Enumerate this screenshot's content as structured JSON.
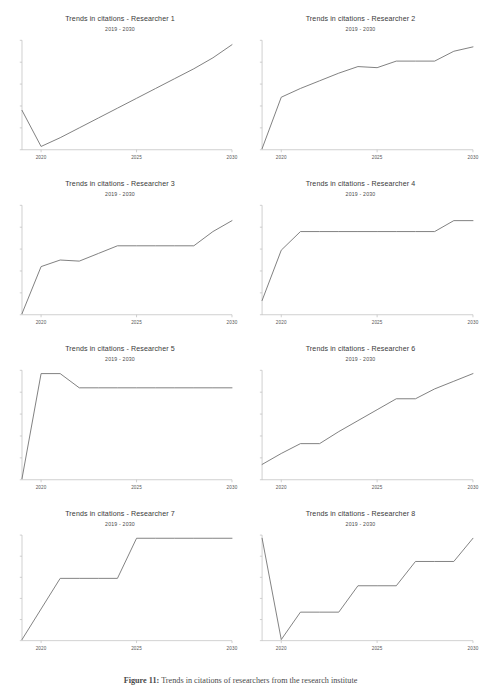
{
  "figure": {
    "caption_label": "Figure 11:",
    "caption_text": "Trends in citations of researchers from the research institute",
    "line_color": "#6e6e6e",
    "axis_color": "#bdbdbd"
  },
  "chart_data": [
    {
      "type": "line",
      "title": "Trends in citations - Researcher 1",
      "subtitle": "2019 - 2030",
      "xlabel": "",
      "ylabel": "",
      "xlim": [
        2019,
        2030
      ],
      "ylim": [
        0,
        10
      ],
      "xticks": [
        2020,
        2025,
        2030
      ],
      "xtick_labels": [
        "2020",
        "2025",
        "2030"
      ],
      "yticks": [
        0,
        2,
        4,
        6,
        8,
        10
      ],
      "ytick_labels": [
        "",
        "",
        "",
        "",
        "",
        ""
      ],
      "grid": false,
      "legend": false,
      "x": [
        2019,
        2020,
        2021,
        2022,
        2023,
        2024,
        2025,
        2026,
        2027,
        2028,
        2029,
        2030
      ],
      "values": [
        3.6,
        0.3,
        1.1,
        2.0,
        2.9,
        3.8,
        4.7,
        5.6,
        6.5,
        7.4,
        8.4,
        9.6
      ]
    },
    {
      "type": "line",
      "title": "Trends in citations - Researcher 2",
      "subtitle": "2019 - 2030",
      "xlabel": "",
      "ylabel": "",
      "xlim": [
        2019,
        2030
      ],
      "ylim": [
        0,
        10
      ],
      "xticks": [
        2020,
        2025,
        2030
      ],
      "xtick_labels": [
        "2020",
        "2025",
        "2030"
      ],
      "yticks": [
        0,
        2,
        4,
        6,
        8,
        10
      ],
      "ytick_labels": [
        "",
        "",
        "",
        "",
        "",
        ""
      ],
      "grid": false,
      "legend": false,
      "x": [
        2019,
        2020,
        2021,
        2022,
        2023,
        2024,
        2025,
        2026,
        2027,
        2028,
        2029,
        2030
      ],
      "values": [
        0.1,
        4.8,
        5.6,
        6.3,
        7.0,
        7.6,
        7.5,
        8.1,
        8.1,
        8.1,
        9.0,
        9.4
      ]
    },
    {
      "type": "line",
      "title": "Trends in citations - Researcher 3",
      "subtitle": "2019 - 2030",
      "xlabel": "",
      "ylabel": "",
      "xlim": [
        2019,
        2030
      ],
      "ylim": [
        0,
        10
      ],
      "xticks": [
        2020,
        2025,
        2030
      ],
      "xtick_labels": [
        "2020",
        "2025",
        "2030"
      ],
      "yticks": [
        0,
        2,
        4,
        6,
        8,
        10
      ],
      "ytick_labels": [
        "",
        "",
        "",
        "",
        "",
        ""
      ],
      "grid": false,
      "legend": false,
      "x": [
        2019,
        2020,
        2021,
        2022,
        2023,
        2024,
        2025,
        2026,
        2027,
        2028,
        2029,
        2030
      ],
      "values": [
        0.1,
        4.4,
        5.0,
        4.9,
        5.6,
        6.3,
        6.3,
        6.3,
        6.3,
        6.3,
        7.6,
        8.6
      ]
    },
    {
      "type": "line",
      "title": "Trends in citations - Researcher 4",
      "subtitle": "2019 - 2030",
      "xlabel": "",
      "ylabel": "",
      "xlim": [
        2019,
        2030
      ],
      "ylim": [
        0,
        10
      ],
      "xticks": [
        2020,
        2025,
        2030
      ],
      "xtick_labels": [
        "2020",
        "2025",
        "2030"
      ],
      "yticks": [
        0,
        2,
        4,
        6,
        8,
        10
      ],
      "ytick_labels": [
        "",
        "",
        "",
        "",
        "",
        ""
      ],
      "grid": false,
      "legend": false,
      "x": [
        2019,
        2020,
        2021,
        2022,
        2023,
        2024,
        2025,
        2026,
        2027,
        2028,
        2029,
        2030
      ],
      "values": [
        1.3,
        5.9,
        7.6,
        7.6,
        7.6,
        7.6,
        7.6,
        7.6,
        7.6,
        7.6,
        8.6,
        8.6
      ]
    },
    {
      "type": "line",
      "title": "Trends in citations - Researcher 5",
      "subtitle": "2019 - 2030",
      "xlabel": "",
      "ylabel": "",
      "xlim": [
        2019,
        2030
      ],
      "ylim": [
        0,
        10
      ],
      "xticks": [
        2020,
        2025,
        2030
      ],
      "xtick_labels": [
        "2020",
        "2025",
        "2030"
      ],
      "yticks": [
        0,
        2,
        4,
        6,
        8,
        10
      ],
      "ytick_labels": [
        "",
        "",
        "",
        "",
        "",
        ""
      ],
      "grid": false,
      "legend": false,
      "x": [
        2019,
        2020,
        2021,
        2022,
        2023,
        2024,
        2025,
        2026,
        2027,
        2028,
        2029,
        2030
      ],
      "values": [
        0.1,
        9.7,
        9.7,
        8.4,
        8.4,
        8.4,
        8.4,
        8.4,
        8.4,
        8.4,
        8.4,
        8.4
      ]
    },
    {
      "type": "line",
      "title": "Trends in citations - Researcher 6",
      "subtitle": "2019 - 2030",
      "xlabel": "",
      "ylabel": "",
      "xlim": [
        2019,
        2030
      ],
      "ylim": [
        0,
        10
      ],
      "xticks": [
        2020,
        2025,
        2030
      ],
      "xtick_labels": [
        "2020",
        "2025",
        "2030"
      ],
      "yticks": [
        0,
        2,
        4,
        6,
        8,
        10
      ],
      "ytick_labels": [
        "",
        "",
        "",
        "",
        "",
        ""
      ],
      "grid": false,
      "legend": false,
      "x": [
        2019,
        2020,
        2021,
        2022,
        2023,
        2024,
        2025,
        2026,
        2027,
        2028,
        2029,
        2030
      ],
      "values": [
        1.4,
        2.4,
        3.3,
        3.3,
        4.4,
        5.4,
        6.4,
        7.4,
        7.4,
        8.3,
        9.0,
        9.7
      ]
    },
    {
      "type": "line",
      "title": "Trends in citations - Researcher 7",
      "subtitle": "2019 - 2030",
      "xlabel": "",
      "ylabel": "",
      "xlim": [
        2019,
        2030
      ],
      "ylim": [
        0,
        10
      ],
      "xticks": [
        2020,
        2025,
        2030
      ],
      "xtick_labels": [
        "2020",
        "2025",
        "2030"
      ],
      "yticks": [
        0,
        2,
        4,
        6,
        8,
        10
      ],
      "ytick_labels": [
        "",
        "",
        "",
        "",
        "",
        ""
      ],
      "grid": false,
      "legend": false,
      "x": [
        2019,
        2020,
        2021,
        2022,
        2023,
        2024,
        2025,
        2026,
        2027,
        2028,
        2029,
        2030
      ],
      "values": [
        0.1,
        3.0,
        5.9,
        5.9,
        5.9,
        5.9,
        9.7,
        9.7,
        9.7,
        9.7,
        9.7,
        9.7
      ]
    },
    {
      "type": "line",
      "title": "Trends in citations - Researcher 8",
      "subtitle": "2019 - 2030",
      "xlabel": "",
      "ylabel": "",
      "xlim": [
        2019,
        2030
      ],
      "ylim": [
        0,
        10
      ],
      "xticks": [
        2020,
        2025,
        2030
      ],
      "xtick_labels": [
        "2020",
        "2025",
        "2030"
      ],
      "yticks": [
        0,
        2,
        4,
        6,
        8,
        10
      ],
      "ytick_labels": [
        "",
        "",
        "",
        "",
        "",
        ""
      ],
      "grid": false,
      "legend": false,
      "x": [
        2019,
        2020,
        2021,
        2022,
        2023,
        2024,
        2025,
        2026,
        2027,
        2028,
        2029,
        2030
      ],
      "values": [
        9.7,
        0.1,
        2.7,
        2.7,
        2.7,
        5.2,
        5.2,
        5.2,
        7.5,
        7.5,
        7.5,
        9.7
      ]
    }
  ]
}
